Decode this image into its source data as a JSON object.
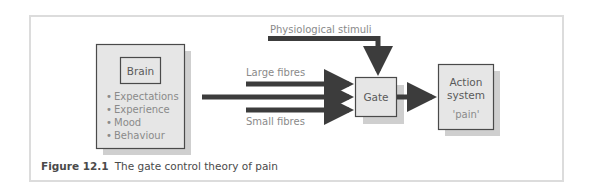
{
  "diagram": {
    "brain_box": {
      "title": "Brain",
      "items": [
        "Expectations",
        "Experience",
        "Mood",
        "Behaviour"
      ]
    },
    "inputs": {
      "physiological": "Physiological stimuli",
      "large": "Large fibres",
      "small": "Small fibres"
    },
    "gate": {
      "label": "Gate"
    },
    "action": {
      "line1": "Action",
      "line2": "system",
      "sub": "'pain'"
    },
    "colors": {
      "box_fill": "#e6e6e6",
      "box_border": "#4a4a4a",
      "shadow": "#c8c8c8",
      "arrow": "#3c3c3c",
      "frame": "#dcdcdc"
    }
  },
  "caption": {
    "number": "Figure 12.1",
    "text": "The gate control theory of pain"
  }
}
